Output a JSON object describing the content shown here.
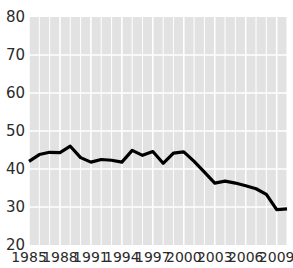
{
  "chart_data": {
    "type": "line",
    "title": "",
    "subtitle": "",
    "xlabel": "",
    "ylabel": "",
    "xlim": [
      1985,
      2010
    ],
    "ylim": [
      20,
      80
    ],
    "grid": true,
    "legend": false,
    "legend_position": "none",
    "y_ticks": [
      80,
      70,
      60,
      50,
      40,
      30,
      20
    ],
    "y_tick_labels": [
      "80",
      "70",
      "60",
      "50",
      "40",
      "30",
      "20"
    ],
    "x_ticks": [
      1985,
      1988,
      1991,
      1994,
      1997,
      2000,
      2003,
      2006,
      2009
    ],
    "x_tick_labels": [
      "1985",
      "1988",
      "1991",
      "1994",
      "1997",
      "2000",
      "2003",
      "2006",
      "2009"
    ],
    "x_minor_ticks": [
      1986,
      1987,
      1989,
      1990,
      1992,
      1993,
      1995,
      1996,
      1998,
      1999,
      2001,
      2002,
      2004,
      2005,
      2007,
      2008,
      2010
    ],
    "x": [
      1985,
      1986,
      1987,
      1988,
      1989,
      1990,
      1991,
      1992,
      1993,
      1994,
      1995,
      1996,
      1997,
      1998,
      1999,
      2000,
      2001,
      2002,
      2003,
      2004,
      2005,
      2006,
      2007,
      2008,
      2009,
      2010
    ],
    "values": [
      42.0,
      43.8,
      44.4,
      44.3,
      46.0,
      43.0,
      41.8,
      42.5,
      42.3,
      41.8,
      44.9,
      43.6,
      44.6,
      41.5,
      44.2,
      44.5,
      42.0,
      39.2,
      36.3,
      36.8,
      36.3,
      35.6,
      34.8,
      33.3,
      29.3,
      29.5
    ],
    "series": [
      {
        "name": "series-1",
        "color": "#000000",
        "values": [
          42.0,
          43.8,
          44.4,
          44.3,
          46.0,
          43.0,
          41.8,
          42.5,
          42.3,
          41.8,
          44.9,
          43.6,
          44.6,
          41.5,
          44.2,
          44.5,
          42.0,
          39.2,
          36.3,
          36.8,
          36.3,
          35.6,
          34.8,
          33.3,
          29.3,
          29.5
        ]
      }
    ],
    "colors": {
      "line": "#000000",
      "plot_background": "#e2e2e2",
      "gridline": "#ffffff",
      "tick_label": "#2b2b2b",
      "page_background": "#ffffff"
    }
  }
}
